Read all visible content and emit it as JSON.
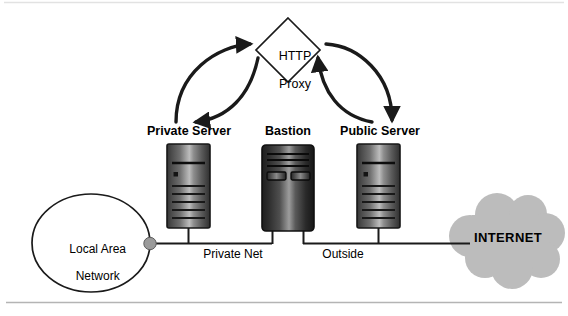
{
  "diagram": {
    "proxy": {
      "label_line1": "HTTP",
      "label_line2": "Proxy",
      "shape": "diamond"
    },
    "nodes": [
      {
        "id": "private-server",
        "label": "Private Server",
        "type": "server-tower"
      },
      {
        "id": "bastion",
        "label": "Bastion",
        "type": "server-tower-bastion"
      },
      {
        "id": "public-server",
        "label": "Public Server",
        "type": "server-tower"
      }
    ],
    "networks": [
      {
        "id": "private-net",
        "label": "Private Net"
      },
      {
        "id": "outside",
        "label": "Outside"
      }
    ],
    "lan": {
      "label_line1": "Local Area",
      "label_line2": "Network",
      "shape": "ellipse"
    },
    "internet": {
      "label": "INTERNET",
      "shape": "cloud"
    },
    "colors": {
      "stroke": "#1a1a1a",
      "cloud_fill": "#bcbcbc",
      "junction_dot": "#9a9a9a",
      "rule": "#b4b4b4",
      "server_dark": "#2e2e2e",
      "server_light": "#c2c2c2",
      "background": "#ffffff"
    },
    "arrows": [
      {
        "id": "private-to-proxy",
        "from": "private-server",
        "to": "proxy",
        "direction": "up-right"
      },
      {
        "id": "proxy-to-private",
        "from": "proxy",
        "to": "private-server",
        "direction": "down-left"
      },
      {
        "id": "proxy-to-public",
        "from": "proxy",
        "to": "public-server",
        "direction": "down-right"
      },
      {
        "id": "public-to-proxy",
        "from": "public-server",
        "to": "proxy",
        "direction": "up-left"
      }
    ]
  }
}
